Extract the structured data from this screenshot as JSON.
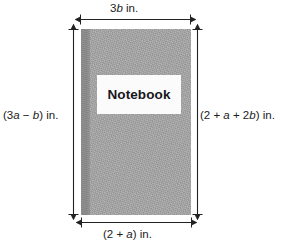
{
  "figure": {
    "name": "notebook-dimension-diagram",
    "background_color": "#ffffff"
  },
  "book": {
    "cover_color": "#a9a9a9",
    "spine_color": "#8a8a8a",
    "label_background": "#fbfbfb",
    "label_text": "Notebook"
  },
  "dimensions": {
    "line_color": "#222222",
    "top": {
      "name": "top-width",
      "text": "3b in.",
      "expression": "3b",
      "unit": "in.",
      "parts": [
        {
          "text": "3",
          "italic": false
        },
        {
          "text": "b",
          "italic": true
        },
        {
          "text": " in.",
          "italic": false
        }
      ]
    },
    "bottom": {
      "name": "bottom-width",
      "text": "(2 + a) in.",
      "expression": "2 + a",
      "unit": "in.",
      "parts": [
        {
          "text": "(2 + ",
          "italic": false
        },
        {
          "text": "a",
          "italic": true
        },
        {
          "text": ") in.",
          "italic": false
        }
      ]
    },
    "left": {
      "name": "left-height",
      "text": "(3a − b) in.",
      "expression": "3a − b",
      "unit": "in.",
      "parts": [
        {
          "text": "(3",
          "italic": false
        },
        {
          "text": "a",
          "italic": true
        },
        {
          "text": " − ",
          "italic": false
        },
        {
          "text": "b",
          "italic": true
        },
        {
          "text": ") in.",
          "italic": false
        }
      ]
    },
    "right": {
      "name": "right-height",
      "text": "(2 + a + 2b) in.",
      "expression": "2 + a + 2b",
      "unit": "in.",
      "parts": [
        {
          "text": "(2 + ",
          "italic": false
        },
        {
          "text": "a",
          "italic": true
        },
        {
          "text": " + 2",
          "italic": false
        },
        {
          "text": "b",
          "italic": true
        },
        {
          "text": ") in.",
          "italic": false
        }
      ]
    }
  }
}
